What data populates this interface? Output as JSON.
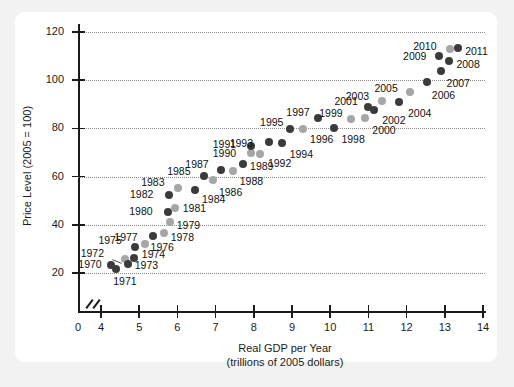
{
  "figure": {
    "background_color": "#f2f2f2",
    "card_color": "#ffffff",
    "point_dark_color": "#3b3b3b",
    "point_light_color": "#a6a6a6"
  },
  "chart_data": {
    "type": "scatter",
    "title": "",
    "xlabel": "Real GDP per Year",
    "xlabel_sub": "(trillions of 2005 dollars)",
    "ylabel": "Price Level (2005 = 100)",
    "xlim": [
      3.5,
      14.2
    ],
    "ylim": [
      10,
      126
    ],
    "xticks": [
      0,
      4,
      5,
      6,
      7,
      8,
      9,
      10,
      11,
      12,
      13,
      14
    ],
    "xtick_labels": [
      "0",
      "4",
      "5",
      "6",
      "7",
      "8",
      "9",
      "10",
      "11",
      "12",
      "13",
      "14"
    ],
    "yticks": [
      20,
      40,
      60,
      80,
      100,
      120
    ],
    "ytick_labels": [
      "20",
      "40",
      "60",
      "80",
      "100",
      "120"
    ],
    "grid": true,
    "grid_axis": "y",
    "axis_break_x": true,
    "legend": "none",
    "points": [
      {
        "label": "1970",
        "x": 4.27,
        "y": 23.5,
        "shade": "dark",
        "lx": -33,
        "ly": -6
      },
      {
        "label": "1971",
        "x": 4.4,
        "y": 21.6,
        "shade": "dark",
        "lx": -3,
        "ly": 7
      },
      {
        "label": "1972",
        "x": 4.62,
        "y": 25.7,
        "shade": "light",
        "lx": -44,
        "ly": -11,
        "leader": true
      },
      {
        "label": "1973",
        "x": 4.7,
        "y": 23.8,
        "shade": "dark",
        "lx": 7,
        "ly": -4
      },
      {
        "label": "1974",
        "x": 4.86,
        "y": 26.2,
        "shade": "dark",
        "lx": 8,
        "ly": -9
      },
      {
        "label": "1975",
        "x": 4.9,
        "y": 30.6,
        "shade": "dark",
        "lx": -37,
        "ly": -12
      },
      {
        "label": "1976",
        "x": 5.14,
        "y": 31.9,
        "shade": "light",
        "lx": 6,
        "ly": -2
      },
      {
        "label": "1977",
        "x": 5.37,
        "y": 35.4,
        "shade": "dark",
        "lx": -39,
        "ly": -4
      },
      {
        "label": "1978",
        "x": 5.64,
        "y": 36.8,
        "shade": "light",
        "lx": 7,
        "ly": -1
      },
      {
        "label": "1979",
        "x": 5.8,
        "y": 41.0,
        "shade": "light",
        "lx": 7,
        "ly": -2
      },
      {
        "label": "1980",
        "x": 5.76,
        "y": 45.2,
        "shade": "dark",
        "lx": -39,
        "ly": -6
      },
      {
        "label": "1981",
        "x": 5.93,
        "y": 47.0,
        "shade": "light",
        "lx": 8,
        "ly": -5
      },
      {
        "label": "1982",
        "x": 5.78,
        "y": 52.2,
        "shade": "dark",
        "lx": -39,
        "ly": -6
      },
      {
        "label": "1983",
        "x": 6.02,
        "y": 55.3,
        "shade": "light",
        "lx": -37,
        "ly": -11
      },
      {
        "label": "1984",
        "x": 6.46,
        "y": 54.6,
        "shade": "dark",
        "lx": 7,
        "ly": 4
      },
      {
        "label": "1985",
        "x": 6.7,
        "y": 60.2,
        "shade": "dark",
        "lx": -37,
        "ly": -10
      },
      {
        "label": "1986",
        "x": 6.93,
        "y": 58.7,
        "shade": "light",
        "lx": 6,
        "ly": 7
      },
      {
        "label": "1987",
        "x": 7.15,
        "y": 62.6,
        "shade": "dark",
        "lx": -36,
        "ly": -11
      },
      {
        "label": "1988",
        "x": 7.45,
        "y": 62.4,
        "shade": "light",
        "lx": 7,
        "ly": 5
      },
      {
        "label": "1989",
        "x": 7.72,
        "y": 65.1,
        "shade": "dark",
        "lx": 7,
        "ly": -3
      },
      {
        "label": "1990",
        "x": 7.92,
        "y": 70.0,
        "shade": "light",
        "lx": -38,
        "ly": -5
      },
      {
        "label": "1991",
        "x": 7.92,
        "y": 72.6,
        "shade": "dark",
        "lx": -38,
        "ly": -7
      },
      {
        "label": "1992",
        "x": 8.16,
        "y": 69.5,
        "shade": "light",
        "lx": 8,
        "ly": 4
      },
      {
        "label": "1993",
        "x": 8.39,
        "y": 74.5,
        "shade": "dark",
        "lx": -39,
        "ly": -4
      },
      {
        "label": "1994",
        "x": 8.73,
        "y": 74.0,
        "shade": "dark",
        "lx": 8,
        "ly": 6
      },
      {
        "label": "1995",
        "x": 8.95,
        "y": 79.7,
        "shade": "dark",
        "lx": -30,
        "ly": -12
      },
      {
        "label": "1996",
        "x": 9.29,
        "y": 79.7,
        "shade": "light",
        "lx": 7,
        "ly": 5
      },
      {
        "label": "1997",
        "x": 9.69,
        "y": 84.2,
        "shade": "dark",
        "lx": -32,
        "ly": -11
      },
      {
        "label": "1998",
        "x": 10.11,
        "y": 80.2,
        "shade": "dark",
        "lx": 7,
        "ly": 6
      },
      {
        "label": "1999",
        "x": 10.55,
        "y": 84.1,
        "shade": "light",
        "lx": -32,
        "ly": -11
      },
      {
        "label": "2000",
        "x": 10.92,
        "y": 84.5,
        "shade": "light",
        "lx": 7,
        "ly": 7
      },
      {
        "label": "2001",
        "x": 11.0,
        "y": 89.0,
        "shade": "dark",
        "lx": -34,
        "ly": -11
      },
      {
        "label": "2002",
        "x": 11.15,
        "y": 87.8,
        "shade": "dark",
        "lx": 8,
        "ly": 5
      },
      {
        "label": "2003",
        "x": 11.35,
        "y": 91.3,
        "shade": "light",
        "lx": -36,
        "ly": -10
      },
      {
        "label": "2004",
        "x": 11.8,
        "y": 91.1,
        "shade": "dark",
        "lx": 9,
        "ly": 6
      },
      {
        "label": "2005",
        "x": 12.1,
        "y": 95.2,
        "shade": "light",
        "lx": -36,
        "ly": -9
      },
      {
        "label": "2006",
        "x": 12.53,
        "y": 99.2,
        "shade": "dark",
        "lx": 5,
        "ly": 8
      },
      {
        "label": "2007",
        "x": 12.89,
        "y": 104.0,
        "shade": "dark",
        "lx": 6,
        "ly": 7
      },
      {
        "label": "2008",
        "x": 13.12,
        "y": 108.0,
        "shade": "dark",
        "lx": 7,
        "ly": -2
      },
      {
        "label": "2009",
        "x": 12.85,
        "y": 110.0,
        "shade": "dark",
        "lx": -36,
        "ly": -5
      },
      {
        "label": "2010",
        "x": 13.14,
        "y": 113.0,
        "shade": "light",
        "lx": -37,
        "ly": -8
      },
      {
        "label": "2011",
        "x": 13.35,
        "y": 113.4,
        "shade": "dark",
        "lx": 7,
        "ly": -2
      }
    ]
  }
}
